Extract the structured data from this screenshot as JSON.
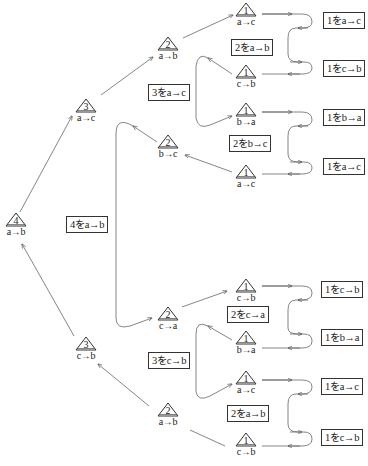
{
  "diagram": {
    "type": "tower-of-hanoi-recursion-tree",
    "root": {
      "n": "4",
      "move": "a→b"
    },
    "nodes": [
      {
        "id": "n4",
        "n": "4",
        "move": "a→b",
        "x": 16,
        "y": 222
      },
      {
        "id": "n3a",
        "n": "3",
        "move": "a→c",
        "x": 86,
        "y": 108
      },
      {
        "id": "n3b",
        "n": "3",
        "move": "c→b",
        "x": 86,
        "y": 346
      },
      {
        "id": "n2a",
        "n": "2",
        "move": "a→b",
        "x": 168,
        "y": 46
      },
      {
        "id": "n2b",
        "n": "2",
        "move": "b→c",
        "x": 168,
        "y": 144
      },
      {
        "id": "n2c",
        "n": "2",
        "move": "c→a",
        "x": 168,
        "y": 316
      },
      {
        "id": "n2d",
        "n": "2",
        "move": "a→b",
        "x": 168,
        "y": 412
      },
      {
        "id": "n1a",
        "n": "1",
        "move": "a→c",
        "x": 246,
        "y": 12
      },
      {
        "id": "n1b",
        "n": "1",
        "move": "c→b",
        "x": 246,
        "y": 74
      },
      {
        "id": "n1c",
        "n": "1",
        "move": "b→a",
        "x": 246,
        "y": 112
      },
      {
        "id": "n1d",
        "n": "1",
        "move": "a→c",
        "x": 246,
        "y": 174
      },
      {
        "id": "n1e",
        "n": "1",
        "move": "c→b",
        "x": 246,
        "y": 288
      },
      {
        "id": "n1f",
        "n": "1",
        "move": "b→a",
        "x": 246,
        "y": 340
      },
      {
        "id": "n1g",
        "n": "1",
        "move": "a→c",
        "x": 246,
        "y": 380
      },
      {
        "id": "n1h",
        "n": "1",
        "move": "c→b",
        "x": 246,
        "y": 442
      }
    ],
    "step_labels": [
      {
        "text": "4をa→b",
        "x": 66,
        "y": 216
      },
      {
        "text": "3をa→c",
        "x": 148,
        "y": 84
      },
      {
        "text": "3をc→b",
        "x": 148,
        "y": 352
      },
      {
        "text": "2をa→b",
        "x": 231,
        "y": 39
      },
      {
        "text": "2をb→c",
        "x": 229,
        "y": 135
      },
      {
        "text": "2をc→a",
        "x": 227,
        "y": 306
      },
      {
        "text": "2をa→b",
        "x": 227,
        "y": 405
      }
    ],
    "results": [
      {
        "text": "1をa→c",
        "x": 323,
        "y": 12
      },
      {
        "text": "1をc→b",
        "x": 323,
        "y": 60
      },
      {
        "text": "1をb→a",
        "x": 323,
        "y": 109
      },
      {
        "text": "1をa→c",
        "x": 323,
        "y": 158
      },
      {
        "text": "1をc→b",
        "x": 321,
        "y": 281
      },
      {
        "text": "1をb→a",
        "x": 321,
        "y": 329
      },
      {
        "text": "1をa→c",
        "x": 321,
        "y": 378
      },
      {
        "text": "1をc→b",
        "x": 321,
        "y": 429
      }
    ]
  }
}
